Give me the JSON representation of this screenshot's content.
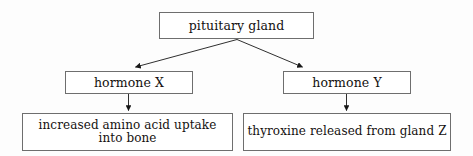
{
  "diagram": {
    "type": "flowchart",
    "background_color": "#fdfdfd",
    "border_color": "#6e6e6e",
    "text_color": "#14110f",
    "nodes": {
      "pituitary": {
        "label": "pituitary gland"
      },
      "hormone_x": {
        "label": "hormone X"
      },
      "hormone_y": {
        "label": "hormone Y"
      },
      "outcome_x": {
        "label": "increased amino acid uptake\ninto bone"
      },
      "outcome_y": {
        "label": "thyroxine released from gland Z"
      }
    },
    "edges": [
      {
        "name": "pituitary-to-hormone-x",
        "from": "pituitary",
        "to": "hormone_x",
        "style": "arrow"
      },
      {
        "name": "pituitary-to-hormone-y",
        "from": "pituitary",
        "to": "hormone_y",
        "style": "arrow"
      },
      {
        "name": "hormone-x-to-outcome-x",
        "from": "hormone_x",
        "to": "outcome_x",
        "style": "arrow"
      },
      {
        "name": "hormone-y-to-outcome-y",
        "from": "hormone_y",
        "to": "outcome_y",
        "style": "arrow"
      }
    ]
  }
}
